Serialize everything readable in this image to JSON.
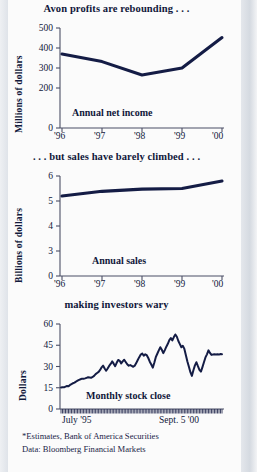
{
  "figure": {
    "background_color": "#c9cfd8",
    "paper_color": "#fbfbfb",
    "ink_color": "#141c45",
    "footnotes": [
      "*Estimates, Bank of America Securities",
      "Data: Bloomberg Financial Markets"
    ]
  },
  "chart_data": [
    {
      "type": "line",
      "id": "net-income",
      "title": "Avon profits are rebounding . . .",
      "series_label": "Annual net income",
      "ylabel": "Millions of dollars",
      "xlabel": "",
      "categories": [
        "'96",
        "'97",
        "'98",
        "'99",
        "'00"
      ],
      "x": [
        1996,
        1997,
        1998,
        1999,
        2000
      ],
      "values": [
        370,
        332,
        265,
        300,
        452
      ],
      "ylim": [
        0,
        500
      ],
      "yticks": [
        0,
        200,
        300,
        400,
        500
      ],
      "ytick_labels": [
        "0",
        "200",
        "300",
        "400",
        "500"
      ],
      "grid": false,
      "legend": "none",
      "note": "2000 value is an estimate"
    },
    {
      "type": "line",
      "id": "annual-sales",
      "title": ". . . but sales have barely climbed . . .",
      "series_label": "Annual sales",
      "ylabel": "Billions of dollars",
      "xlabel": "",
      "categories": [
        "'96",
        "'97",
        "'98",
        "'99",
        "'00"
      ],
      "x": [
        1996,
        1997,
        1998,
        1999,
        2000
      ],
      "values": [
        4.8,
        5.08,
        5.21,
        5.25,
        5.7
      ],
      "ylim": [
        0,
        6
      ],
      "yticks": [
        0,
        3,
        4,
        5,
        6
      ],
      "ytick_labels": [
        "0",
        "3",
        "4",
        "5",
        "6"
      ],
      "grid": false,
      "legend": "none",
      "note": "2000 value is an estimate"
    },
    {
      "type": "line",
      "id": "monthly-stock-close",
      "title": "making investors wary",
      "series_label": "Monthly stock close",
      "ylabel": "Dollars",
      "xlabel": "",
      "x_start_label": "July '95",
      "x_end_label": "Sept. 5 '00",
      "ylim": [
        0,
        60
      ],
      "yticks": [
        0,
        15,
        30,
        45,
        60
      ],
      "ytick_labels": [
        "0",
        "15",
        "30",
        "45",
        "60"
      ],
      "grid": false,
      "legend": "none",
      "values": [
        15.2,
        15.4,
        15.3,
        15.8,
        16.2,
        16.0,
        17.0,
        17.6,
        18.2,
        18.6,
        19.4,
        20.0,
        20.6,
        21.0,
        21.4,
        21.3,
        21.6,
        22.0,
        22.4,
        22.2,
        22.0,
        22.6,
        23.4,
        24.6,
        25.4,
        26.2,
        27.6,
        29.4,
        30.6,
        28.6,
        27.0,
        28.6,
        30.4,
        31.8,
        33.6,
        32.0,
        30.2,
        32.6,
        34.6,
        34.0,
        32.2,
        33.6,
        34.8,
        33.2,
        31.6,
        30.6,
        31.0,
        30.4,
        29.8,
        30.6,
        32.4,
        34.6,
        36.6,
        38.4,
        39.2,
        37.6,
        38.6,
        38.0,
        36.0,
        33.4,
        31.4,
        29.2,
        32.6,
        36.6,
        39.0,
        41.4,
        43.6,
        41.8,
        39.4,
        41.6,
        44.0,
        46.0,
        48.6,
        50.0,
        48.4,
        50.8,
        52.6,
        51.0,
        48.0,
        45.8,
        43.6,
        44.6,
        42.4,
        38.0,
        33.6,
        29.8,
        26.0,
        23.4,
        27.4,
        30.8,
        33.0,
        30.2,
        27.6,
        26.4,
        29.6,
        33.0,
        36.4,
        38.6,
        41.4,
        39.6,
        38.2,
        38.4,
        38.6,
        38.4,
        38.6,
        38.4,
        38.8,
        38.6
      ]
    }
  ]
}
